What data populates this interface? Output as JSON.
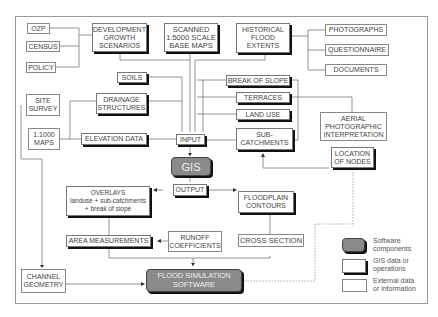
{
  "diagram": {
    "external_sources": [
      "OZP",
      "CENSUS",
      "POLICY",
      "PHOTOGRAPHS",
      "QUESTIONNAIRE",
      "DOCUMENTS",
      "SITE\nSURVEY",
      "1:1000\nMAPS",
      "AERIAL\nPHOTOGRAPHIC\nINTERPRETATION",
      "CHANNEL\nGEOMETRY",
      "RUNOFF\nCOEFFICIENTS",
      "CROSS SECTION"
    ],
    "nodes": {
      "ozp": "OZP",
      "census": "CENSUS",
      "policy": "POLICY",
      "development": "DEVELOPMENT\nGROWTH\nSCENARIOS",
      "scanned": "SCANNED\n1:5000 SCALE\nBASE MAPS",
      "historical": "HISTORICAL\nFLOOD\nEXTENTS",
      "photographs": "PHOTOGRAPHS",
      "questionnaire": "QUESTIONNAIRE",
      "documents": "DOCUMENTS",
      "soils": "SOILS",
      "break_of_slope": "BREAK OF SLOPE",
      "terraces": "TERRACES",
      "land_use": "LAND USE",
      "sub_catchments": "SUB-\nCATCHMENTS",
      "aerial": "AERIAL\nPHOTOGRAPHIC\nINTERPRETATION",
      "site_survey": "SITE\nSURVEY",
      "drainage": "DRAINAGE\nSTRUCTURES",
      "maps_1000": "1:1000\nMAPS",
      "elevation": "ELEVATION DATA",
      "input": "INPUT",
      "gis": "GIS",
      "location_nodes": "LOCATION\nOF NODES",
      "overlays": "OVERLAYS\nlanduse + sub-catchments\n+ break of slope",
      "output": "OUTPUT",
      "floodplain": "FLOODPLAIN\nCONTOURS",
      "area_measurements": "AREA MEASUREMENTS",
      "runoff": "RUNOFF\nCOEFFICIENTS",
      "cross_section": "CROSS SECTION",
      "channel": "CHANNEL\nGEOMETRY",
      "flood_sim": "FLOOD SIMULATION\nSOFTWARE"
    },
    "legend": {
      "software": "Software\ncomponents",
      "gis_data": "GIS data or\noperations",
      "external": "External data\nor information"
    },
    "colors": {
      "software_fill": "#8a8a8a",
      "line": "#777777",
      "shadow": "#111111"
    }
  }
}
